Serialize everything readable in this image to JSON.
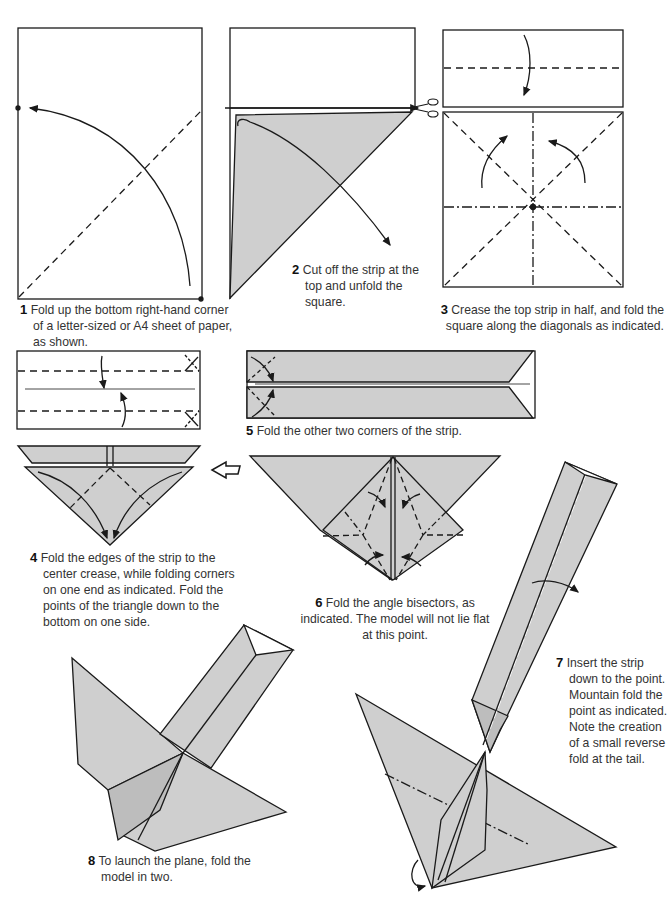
{
  "colors": {
    "paper_fill": "#cfcfcf",
    "line": "#1a1a1a",
    "background": "#ffffff",
    "text": "#333333"
  },
  "steps": [
    {
      "num": "1",
      "text": "Fold up the bottom right-hand corner of a letter-sized or A4 sheet of paper, as shown."
    },
    {
      "num": "2",
      "text": "Cut off the strip at the top and unfold the square."
    },
    {
      "num": "3",
      "text": "Crease the top strip in half, and fold the square along the diagonals as indicated."
    },
    {
      "num": "4",
      "text": "Fold the edges of the strip to the center crease, while folding corners on one end as indicated. Fold the points of the triangle down to the bottom on one side."
    },
    {
      "num": "5",
      "text": "Fold the other two corners of the strip."
    },
    {
      "num": "6",
      "text": "Fold the angle bisectors, as indicated. The model will not lie flat at this point."
    },
    {
      "num": "7",
      "text": "Insert the strip down to the point. Mountain fold the point as indicated. Note the creation of a small reverse fold at the tail."
    },
    {
      "num": "8",
      "text": "To launch the plane, fold the model in two."
    }
  ],
  "icons": [
    "scissors-icon",
    "hollow-arrow-icon",
    "fold-arrow-icon"
  ]
}
